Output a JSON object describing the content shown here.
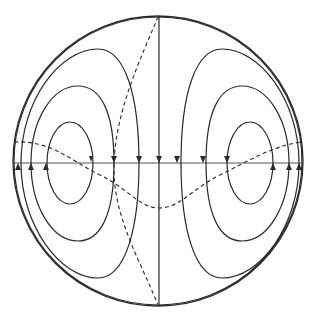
{
  "diagram": {
    "type": "flow-field-in-circle",
    "colors": {
      "background": "#ffffff",
      "stroke": "#2a2a2a",
      "axis": "#555555"
    },
    "circle": {
      "cx": 158,
      "cy": 160,
      "r": 145
    },
    "horizontal_axis_y": 160,
    "vertical_axis_x": 159,
    "left_cell_loops": 4,
    "right_cell_loops": 4,
    "arrows": {
      "downward_on_axis": 8,
      "upward_on_axis": 6
    },
    "dashed_curves": [
      "s-curve-horizontal",
      "near-vertical-curve"
    ]
  }
}
